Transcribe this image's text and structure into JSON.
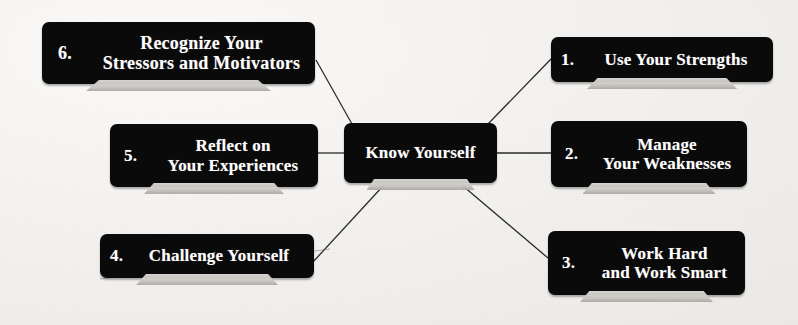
{
  "diagram": {
    "title": "Know Yourself",
    "type": "hub-and-spoke-mind-map",
    "background_color": "#f3f2f0",
    "node_color": "#0a0a0a",
    "text_color": "#fdfdfd",
    "center": {
      "label": "Know Yourself"
    },
    "nodes": [
      {
        "number": "1.",
        "label": "Use Your Strengths",
        "position": "top-right"
      },
      {
        "number": "2.",
        "label": "Manage\nYour Weaknesses",
        "position": "middle-right"
      },
      {
        "number": "3.",
        "label": "Work Hard\nand Work Smart",
        "position": "bottom-right"
      },
      {
        "number": "4.",
        "label": "Challenge Yourself",
        "position": "bottom-left"
      },
      {
        "number": "5.",
        "label": "Reflect on\nYour  Experiences",
        "position": "middle-left"
      },
      {
        "number": "6.",
        "label": "Recognize Your\nStressors and Motivators",
        "position": "top-left"
      }
    ],
    "connectors": [
      {
        "from": "center",
        "to": "6",
        "style": "diagonal-line"
      },
      {
        "from": "center",
        "to": "1",
        "style": "diagonal-line"
      },
      {
        "from": "center",
        "to": "5",
        "style": "horizontal-line"
      },
      {
        "from": "center",
        "to": "2",
        "style": "horizontal-line"
      },
      {
        "from": "center",
        "to": "4",
        "style": "diagonal-line"
      },
      {
        "from": "center",
        "to": "3",
        "style": "diagonal-line"
      }
    ]
  }
}
